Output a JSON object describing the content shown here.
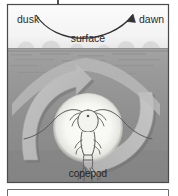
{
  "figure": {
    "kind": "diel-vertical-migration-diagram",
    "subject": "copepod",
    "labels": {
      "dusk": "dusk",
      "dawn": "dawn",
      "surface": "surface",
      "copepod": "copepod"
    },
    "annotations": {
      "top_arc_arrow": "night-time-arc-from-dusk-to-dawn",
      "migration_up_arrow": "upward-migration-at-dusk",
      "migration_down_arrow": "downward-migration-at-dawn"
    },
    "colors": {
      "page_background": "#ffffff",
      "sky_band": "#f2f2f2",
      "water_upper": "#9a9a9a",
      "water_lower": "#8c8c8c",
      "water_deep": "#7f7f7f",
      "arrow_fill": "#b9b9b9",
      "arrow_shadow": "#6f6f6f",
      "halo": "#f6f6f3",
      "frame_line": "#4a4a4a",
      "text": "#2b2b2b",
      "copepod_ink": "#555555"
    },
    "frame": {
      "outer_top": 4,
      "outer_left": 7,
      "outer_right": 169,
      "outer_bottom": 183,
      "stem_x": 58
    }
  }
}
